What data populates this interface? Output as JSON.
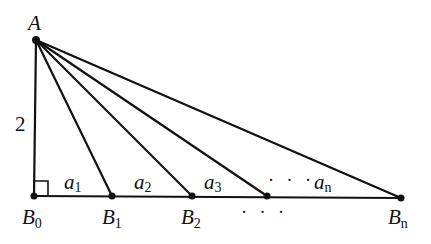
{
  "diagram": {
    "points": {
      "A": {
        "label": "A",
        "x": 36,
        "y": 40
      },
      "B0": {
        "label": "B",
        "sub": "0",
        "x": 34,
        "y": 196
      },
      "B1": {
        "label": "B",
        "sub": "1",
        "x": 112,
        "y": 196
      },
      "B2": {
        "label": "B",
        "sub": "2",
        "x": 192,
        "y": 196
      },
      "B3": {
        "x": 267,
        "y": 196
      },
      "Bn": {
        "label": "B",
        "sub": "n",
        "x": 401,
        "y": 198
      }
    },
    "side_label": "2",
    "segments": [
      {
        "label": "a",
        "sub": "1"
      },
      {
        "label": "a",
        "sub": "2"
      },
      {
        "label": "a",
        "sub": "3"
      },
      {
        "label": "a",
        "sub": "n"
      }
    ],
    "ellipsis_top": "· · ·",
    "ellipsis_bottom": "· · ·",
    "stroke_color": "#111111"
  }
}
